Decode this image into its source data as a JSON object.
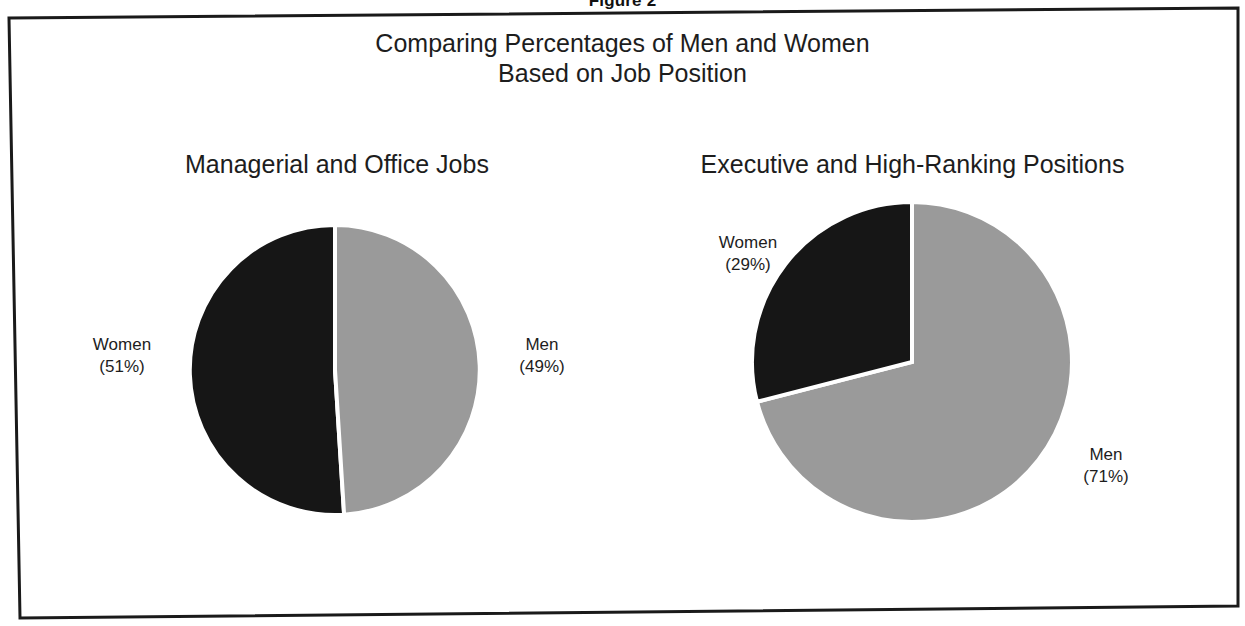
{
  "figure": {
    "caption": "Figure 2"
  },
  "chart_data": {
    "type": "pie",
    "title": "Comparing Percentages of Men and Women Based on Job Position",
    "title_line1": "Comparing Percentages of Men and Women",
    "title_line2": "Based on Job Position",
    "legend_position": "none",
    "colors": {
      "women": "#161616",
      "men": "#9a9a9a",
      "slice_outline": "#ffffff",
      "frame": "#1a1a1a",
      "background": "#ffffff",
      "text": "#1d1d1d"
    },
    "panels": [
      {
        "title": "Managerial and Office Jobs",
        "categories": [
          "Women",
          "Men"
        ],
        "values": [
          51,
          49
        ],
        "labels": [
          {
            "name": "Women",
            "percent": "(51%)",
            "value": 51,
            "color": "#161616"
          },
          {
            "name": "Men",
            "percent": "(49%)",
            "value": 49,
            "color": "#9a9a9a"
          }
        ]
      },
      {
        "title": "Executive and High-Ranking Positions",
        "categories": [
          "Women",
          "Men"
        ],
        "values": [
          29,
          71
        ],
        "labels": [
          {
            "name": "Women",
            "percent": "(29%)",
            "value": 29,
            "color": "#161616"
          },
          {
            "name": "Men",
            "percent": "(71%)",
            "value": 71,
            "color": "#9a9a9a"
          }
        ]
      }
    ]
  }
}
